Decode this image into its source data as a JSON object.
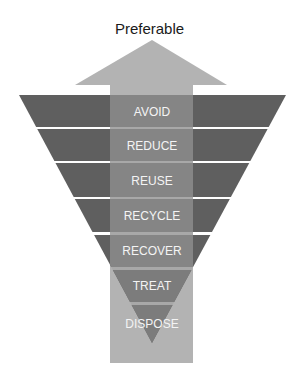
{
  "title": "Preferable",
  "colors": {
    "band": "#5f5f5f",
    "band_in_arrow": "#858585",
    "arrow": "#b3b3b3",
    "gap_in_arrow": "#a8a8a8",
    "label": "#f4f4f4"
  },
  "levels": [
    {
      "label": "AVOID"
    },
    {
      "label": "REDUCE"
    },
    {
      "label": "REUSE"
    },
    {
      "label": "RECYCLE"
    },
    {
      "label": "RECOVER"
    },
    {
      "label": "TREAT"
    },
    {
      "label": "DISPOSE"
    }
  ]
}
